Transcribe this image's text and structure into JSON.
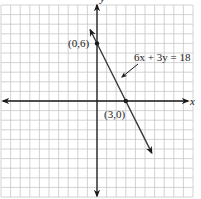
{
  "chart_data": {
    "type": "line",
    "title": "",
    "xlabel": "x",
    "ylabel": "y",
    "xlim": [
      -10,
      10
    ],
    "ylim": [
      -10,
      10
    ],
    "grid": true,
    "grid_step": 1,
    "series": [
      {
        "name": "6x + 3y = 18",
        "equation": "6x + 3y = 18",
        "slope": -2,
        "intercept": 6,
        "x": [
          -0.7,
          5.7
        ],
        "y": [
          7.4,
          -5.4
        ]
      }
    ],
    "points": [
      {
        "label": "(0,6)",
        "x": 0,
        "y": 6
      },
      {
        "label": "(3,0)",
        "x": 3,
        "y": 0
      }
    ],
    "annotations": [
      {
        "text": "6x + 3y = 18",
        "points_to": "line"
      }
    ]
  },
  "colors": {
    "grid": "#c8c8c8",
    "axis": "#1a1a1a",
    "line": "#333333"
  }
}
